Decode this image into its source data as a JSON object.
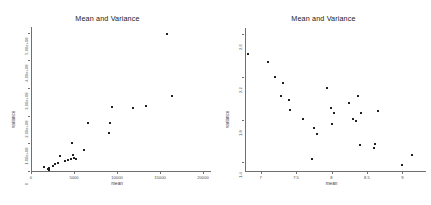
{
  "figure": {
    "background_color": "#ffffff",
    "axis_color": "#6f6f6f",
    "point_color": "#1c1c1c",
    "width": 431,
    "height": 205
  },
  "chart_data": [
    {
      "type": "scatter",
      "panel": "left",
      "title": "Mean and Variance",
      "xlabel": "mean",
      "ylabel": "variance",
      "xlim": [
        0,
        20000
      ],
      "ylim": [
        0,
        520000000
      ],
      "xticks": [
        0,
        5000,
        10000,
        15000,
        20000
      ],
      "xticklabels": [
        "0",
        "5000",
        "10000",
        "15000",
        "20000"
      ],
      "yticks": [
        0,
        100000000,
        200000000,
        300000000,
        400000000,
        500000000
      ],
      "yticklabels": [
        "0",
        "1.00e+08",
        "2.00e+08",
        "3.00e+08",
        "4.00e+08",
        "5.00e+08"
      ],
      "grid": false,
      "legend": null,
      "points": [
        {
          "x": 1500,
          "y": 13000000
        },
        {
          "x": 2000,
          "y": 6000000
        },
        {
          "x": 2050,
          "y": 10000000
        },
        {
          "x": 2100,
          "y": 4000000
        },
        {
          "x": 2150,
          "y": 7000000
        },
        {
          "x": 2600,
          "y": 19000000
        },
        {
          "x": 2750,
          "y": 25000000
        },
        {
          "x": 3100,
          "y": 30000000
        },
        {
          "x": 3400,
          "y": 55000000
        },
        {
          "x": 3900,
          "y": 37000000
        },
        {
          "x": 4300,
          "y": 40000000
        },
        {
          "x": 4600,
          "y": 43000000
        },
        {
          "x": 4800,
          "y": 100000000
        },
        {
          "x": 4900,
          "y": 58000000
        },
        {
          "x": 5050,
          "y": 47000000
        },
        {
          "x": 5200,
          "y": 45000000
        },
        {
          "x": 6200,
          "y": 75000000
        },
        {
          "x": 6600,
          "y": 172000000
        },
        {
          "x": 9100,
          "y": 136000000
        },
        {
          "x": 9200,
          "y": 172000000
        },
        {
          "x": 9400,
          "y": 232000000
        },
        {
          "x": 11900,
          "y": 228000000
        },
        {
          "x": 13400,
          "y": 235000000
        },
        {
          "x": 15800,
          "y": 495000000
        },
        {
          "x": 16400,
          "y": 272000000
        }
      ]
    },
    {
      "type": "scatter",
      "panel": "right",
      "title": "Mean and Variance",
      "xlabel": "mean",
      "ylabel": "variance",
      "xlim": [
        6.78,
        9.22
      ],
      "ylim": [
        1.32,
        2.66
      ],
      "xticks": [
        7,
        7.5,
        8,
        8.5,
        9
      ],
      "xticklabels": [
        "7",
        "7.5",
        "8",
        "8.5",
        "9"
      ],
      "yticks": [
        1.4,
        1.8,
        2.2,
        2.6
      ],
      "yticklabels": [
        "1.4",
        "1.8",
        "2.2",
        "2.6"
      ],
      "grid": false,
      "legend": null,
      "points": [
        {
          "x": 6.82,
          "y": 2.42
        },
        {
          "x": 7.11,
          "y": 2.34
        },
        {
          "x": 7.21,
          "y": 2.2
        },
        {
          "x": 7.32,
          "y": 2.14
        },
        {
          "x": 7.29,
          "y": 2.02
        },
        {
          "x": 7.4,
          "y": 1.99
        },
        {
          "x": 7.42,
          "y": 1.89
        },
        {
          "x": 7.6,
          "y": 1.81
        },
        {
          "x": 7.75,
          "y": 1.72
        },
        {
          "x": 7.79,
          "y": 1.67
        },
        {
          "x": 7.94,
          "y": 2.1
        },
        {
          "x": 7.99,
          "y": 1.91
        },
        {
          "x": 8.01,
          "y": 1.76
        },
        {
          "x": 8.04,
          "y": 1.86
        },
        {
          "x": 8.24,
          "y": 1.96
        },
        {
          "x": 8.3,
          "y": 1.81
        },
        {
          "x": 8.38,
          "y": 2.02
        },
        {
          "x": 8.34,
          "y": 1.79
        },
        {
          "x": 8.42,
          "y": 1.86
        },
        {
          "x": 8.4,
          "y": 1.56
        },
        {
          "x": 8.62,
          "y": 1.57
        },
        {
          "x": 8.66,
          "y": 1.88
        },
        {
          "x": 8.6,
          "y": 1.54
        },
        {
          "x": 7.72,
          "y": 1.43
        },
        {
          "x": 9.0,
          "y": 1.38
        },
        {
          "x": 9.14,
          "y": 1.47
        }
      ]
    }
  ]
}
